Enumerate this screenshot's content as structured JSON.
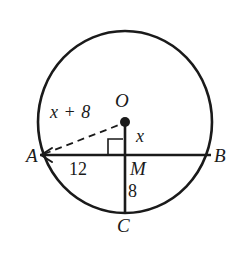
{
  "figure": {
    "type": "circle-geometry-diagram",
    "colors": {
      "stroke": "#1a1a1a",
      "background": "#ffffff",
      "text": "#1a1a1a"
    },
    "points": [
      {
        "id": "A",
        "label": "A",
        "role": "chord-endpoint-left"
      },
      {
        "id": "B",
        "label": "B",
        "role": "chord-endpoint-right"
      },
      {
        "id": "O",
        "label": "O",
        "role": "circle-center"
      },
      {
        "id": "M",
        "label": "M",
        "role": "chord-midpoint-foot"
      },
      {
        "id": "C",
        "label": "C",
        "role": "point-on-circle-bottom"
      }
    ],
    "measures": [
      {
        "id": "radius-OA",
        "label": "x + 8",
        "segment": "OA",
        "style": "dashed"
      },
      {
        "id": "segment-OM",
        "label": "x",
        "segment": "OM",
        "style": "solid"
      },
      {
        "id": "segment-AM",
        "label": "12",
        "segment": "AM",
        "style": "solid"
      },
      {
        "id": "segment-MC",
        "label": "8",
        "segment": "MC",
        "style": "solid"
      }
    ],
    "marks": [
      {
        "id": "right-angle-at-M",
        "label": "right-angle-mark",
        "at": "M"
      },
      {
        "id": "arrowhead-at-A",
        "label": "arrowhead",
        "at": "A",
        "direction": "left"
      },
      {
        "id": "center-dot-O",
        "label": "center-dot",
        "at": "O"
      }
    ]
  }
}
